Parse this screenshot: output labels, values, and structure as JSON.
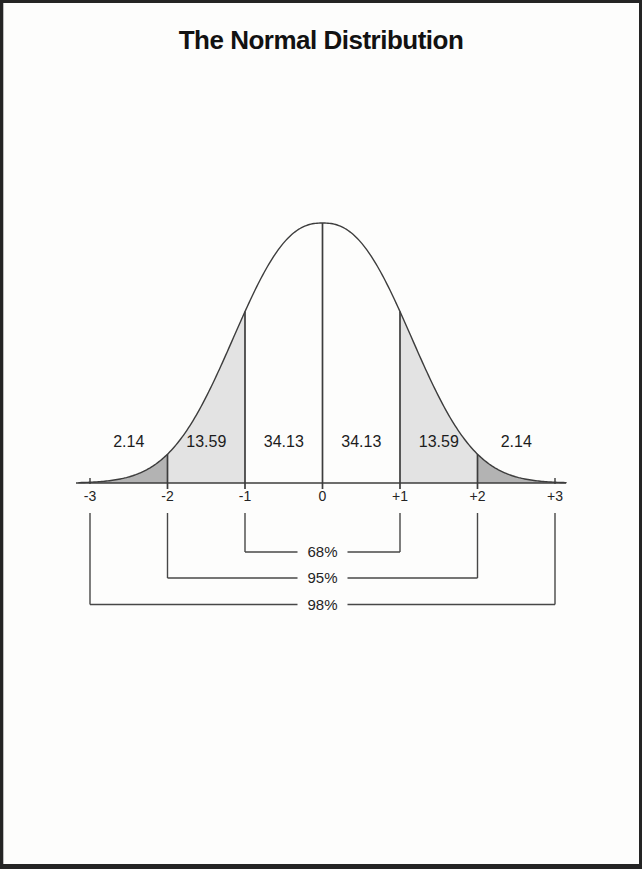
{
  "chart_data": {
    "type": "area",
    "subtype": "normal-distribution-bell-curve",
    "title": "The Normal Distribution",
    "xlabel": "",
    "ylabel": "",
    "grid": false,
    "legend": false,
    "x_axis": {
      "tick_values": [
        -3,
        -2,
        -1,
        0,
        1,
        2,
        3
      ],
      "tick_labels": [
        "-3",
        "-2",
        "-1",
        "0",
        "+1",
        "+2",
        "+3"
      ]
    },
    "curve": {
      "distribution": "standard normal",
      "mean": 0,
      "peak_at": 0
    },
    "regions": [
      {
        "from": -3,
        "to": -2,
        "label": "2.14",
        "percent": 2.14,
        "shade": "dark"
      },
      {
        "from": -2,
        "to": -1,
        "label": "13.59",
        "percent": 13.59,
        "shade": "light"
      },
      {
        "from": -1,
        "to": 0,
        "label": "34.13",
        "percent": 34.13,
        "shade": "none"
      },
      {
        "from": 0,
        "to": 1,
        "label": "34.13",
        "percent": 34.13,
        "shade": "none"
      },
      {
        "from": 1,
        "to": 2,
        "label": "13.59",
        "percent": 13.59,
        "shade": "light"
      },
      {
        "from": 2,
        "to": 3,
        "label": "2.14",
        "percent": 2.14,
        "shade": "dark"
      }
    ],
    "brackets": [
      {
        "from": -1,
        "to": 1,
        "label": "68%"
      },
      {
        "from": -2,
        "to": 2,
        "label": "95%"
      },
      {
        "from": -3,
        "to": 3,
        "label": "98%"
      }
    ],
    "colors": {
      "line": "#3d3d3d",
      "bracket_line": "#474747",
      "dark": "#b3b3b3",
      "light": "#e3e3e3",
      "none": "none",
      "text": "#1c1c1c",
      "background": "#fdfdfc",
      "border": "#242424"
    }
  }
}
